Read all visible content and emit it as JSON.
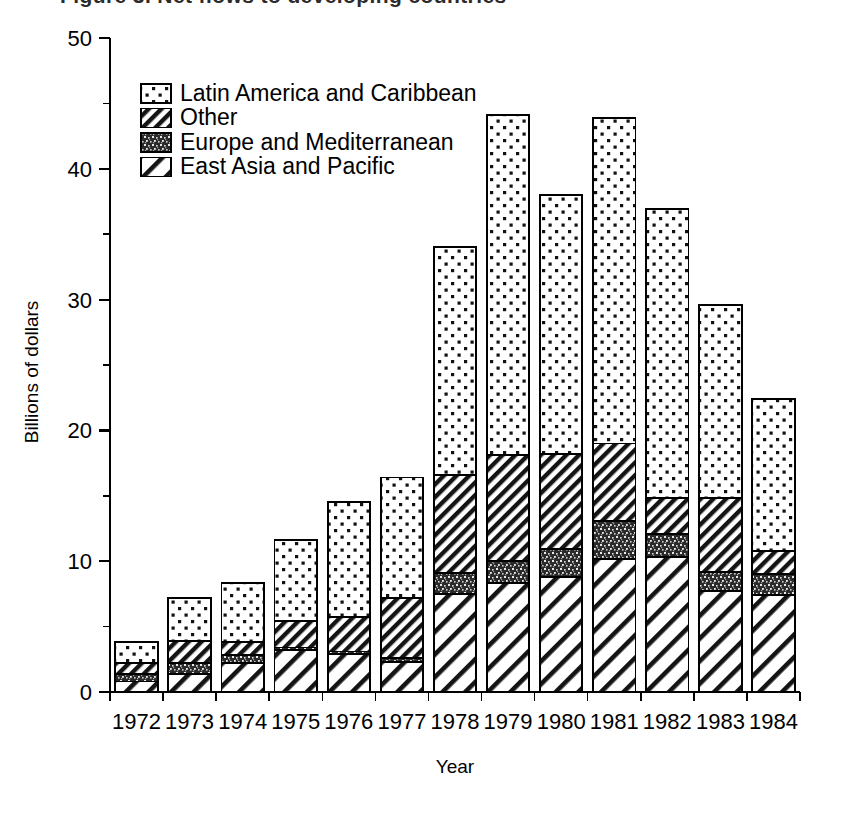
{
  "figure": {
    "title_partial": "Figure 3. Net flows to developing countries",
    "background": "#ffffff",
    "ink_color": "#000000"
  },
  "chart_data": {
    "type": "bar",
    "subtype": "stacked-bar",
    "title": "",
    "xlabel": "Year",
    "ylabel": "Billions of dollars",
    "categories": [
      "1972",
      "1973",
      "1974",
      "1975",
      "1976",
      "1977",
      "1978",
      "1979",
      "1980",
      "1981",
      "1982",
      "1983",
      "1984"
    ],
    "ylim": [
      0,
      50
    ],
    "yticks": [
      0,
      10,
      20,
      30,
      40,
      50
    ],
    "ytick_labels": [
      "0",
      "10",
      "20",
      "30",
      "40",
      "50"
    ],
    "yminor_ticks": [
      5,
      15,
      25,
      35,
      45
    ],
    "grid": false,
    "stack_order_bottom_to_top": [
      "East Asia and Pacific",
      "Europe and Mediterranean",
      "Other",
      "Latin America and Caribbean"
    ],
    "legend_position": "upper-left",
    "series": [
      {
        "name": "Latin America and Caribbean",
        "pattern": "light-dots",
        "values": [
          1.6,
          3.3,
          4.5,
          6.2,
          8.8,
          9.2,
          17.4,
          26.0,
          19.8,
          24.9,
          22.1,
          14.8,
          11.6
        ]
      },
      {
        "name": "Other",
        "pattern": "diagonal-hatch-thin",
        "values": [
          0.8,
          1.7,
          1.0,
          2.0,
          2.6,
          4.6,
          7.5,
          8.1,
          7.3,
          5.9,
          2.7,
          5.6,
          1.8
        ]
      },
      {
        "name": "Europe and Mediterranean",
        "pattern": "dense-speckle",
        "values": [
          0.6,
          0.8,
          0.6,
          0.2,
          0.2,
          0.3,
          1.6,
          1.7,
          2.1,
          2.9,
          1.8,
          1.5,
          1.6
        ]
      },
      {
        "name": "East Asia and Pacific",
        "pattern": "diagonal-hatch-wide",
        "values": [
          0.8,
          1.4,
          2.2,
          3.2,
          2.9,
          2.3,
          7.5,
          8.3,
          8.8,
          10.2,
          10.3,
          7.7,
          7.4
        ]
      }
    ],
    "totals": [
      3.8,
      7.2,
      8.3,
      11.6,
      14.5,
      16.4,
      34.0,
      44.1,
      38.0,
      43.9,
      36.9,
      29.6,
      22.4
    ]
  },
  "legend": {
    "entries": [
      {
        "label": "Latin America and Caribbean",
        "pattern": "light-dots"
      },
      {
        "label": "Other",
        "pattern": "diagonal-hatch-thin"
      },
      {
        "label": "Europe and Mediterranean",
        "pattern": "dense-speckle"
      },
      {
        "label": "East Asia and Pacific",
        "pattern": "diagonal-hatch-wide"
      }
    ]
  }
}
